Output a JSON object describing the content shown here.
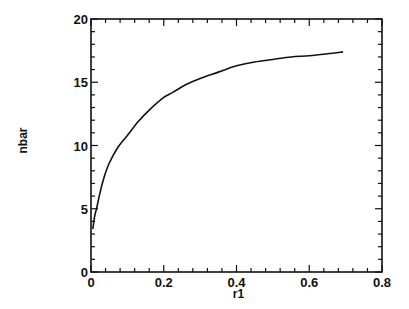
{
  "chart_data": {
    "type": "line",
    "title": "",
    "xlabel": "r1",
    "ylabel": "nbar",
    "xlim": [
      0,
      0.8
    ],
    "ylim": [
      0,
      20
    ],
    "grid": false,
    "legend": null,
    "x_ticks": [
      0,
      0.2,
      0.4,
      0.6,
      0.8
    ],
    "x_tick_labels": [
      "0",
      "0.2",
      "0.4",
      "0.6",
      "0.8"
    ],
    "x_minor_step": 0.04,
    "y_ticks": [
      0,
      5,
      10,
      15,
      20
    ],
    "y_tick_labels": [
      "0",
      "5",
      "10",
      "15",
      "20"
    ],
    "y_minor_step": 1,
    "series": [
      {
        "name": "nbar(r1)",
        "color": "#111111",
        "x": [
          0.005,
          0.01,
          0.016,
          0.025,
          0.035,
          0.05,
          0.075,
          0.1,
          0.13,
          0.16,
          0.2,
          0.225,
          0.26,
          0.3,
          0.35,
          0.4,
          0.45,
          0.5,
          0.55,
          0.6,
          0.65,
          0.693
        ],
        "y": [
          3.4,
          4.4,
          5.1,
          6.3,
          7.4,
          8.6,
          9.9,
          10.8,
          11.9,
          12.8,
          13.8,
          14.2,
          14.8,
          15.3,
          15.8,
          16.3,
          16.6,
          16.8,
          17.0,
          17.1,
          17.25,
          17.4
        ]
      }
    ]
  }
}
